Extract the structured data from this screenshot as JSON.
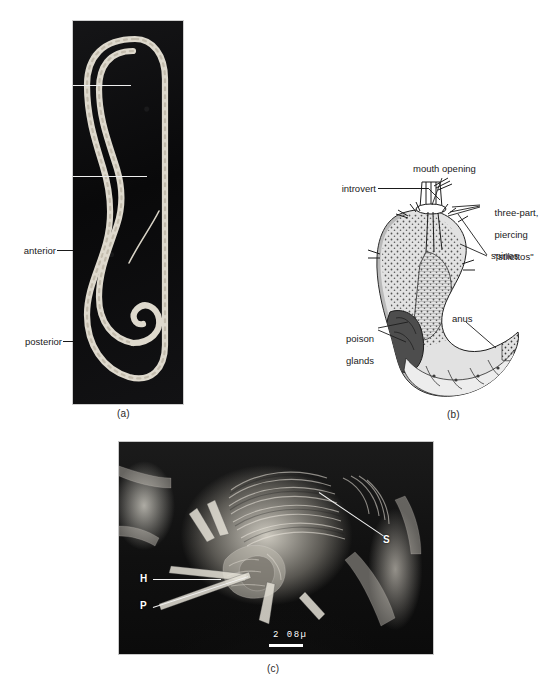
{
  "figure": {
    "panels": [
      {
        "id": "a",
        "caption": "(a)",
        "type": "photomicrograph",
        "labels": [
          {
            "name": "anterior",
            "text": "anterior"
          },
          {
            "name": "posterior",
            "text": "posterior"
          }
        ]
      },
      {
        "id": "b",
        "caption": "(b)",
        "type": "line-drawing",
        "labels": [
          {
            "name": "mouth-opening",
            "text": "mouth opening"
          },
          {
            "name": "introvert",
            "text": "introvert"
          },
          {
            "name": "stilettos",
            "line1": "three-part,",
            "line2": "piercing",
            "line3": "\"stilettos\""
          },
          {
            "name": "spines",
            "text": "spines"
          },
          {
            "name": "anus",
            "text": "anus"
          },
          {
            "name": "poison-glands",
            "line1": "poison",
            "line2": "glands"
          }
        ]
      },
      {
        "id": "c",
        "caption": "(c)",
        "type": "scanning-electron-micrograph",
        "labels": [
          {
            "name": "s",
            "text": "S"
          },
          {
            "name": "h",
            "text": "H"
          },
          {
            "name": "p",
            "text": "P"
          }
        ],
        "scale_bar": {
          "text": "2 08µ"
        }
      }
    ]
  },
  "colors": {
    "ink": "#1d1d1d",
    "photo_background": "#0d0d0e",
    "worm_body": "#ded9cd",
    "poison_gland_fill": "#4d4d4d",
    "gut_fill": "#b4b4b4",
    "body_fill": "#e2e2e2",
    "label_white": "#ffffff"
  }
}
